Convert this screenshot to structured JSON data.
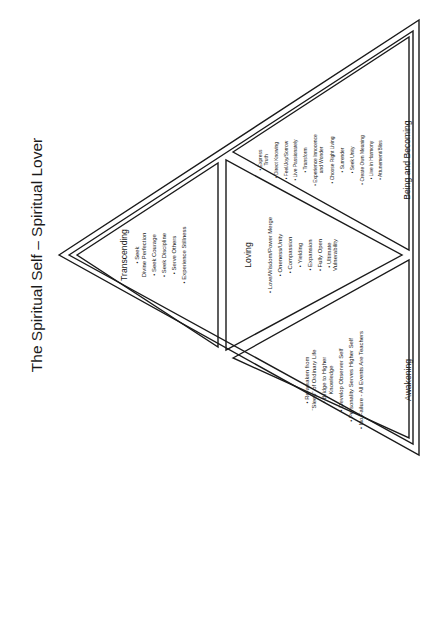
{
  "title": "The Spiritual Self – Spiritual Lover",
  "sections": {
    "transcending": {
      "heading": "Transcending",
      "items": [
        "• Seek",
        "Divine Perfection",
        "• Seek Courage",
        "• Seek Discipline",
        "• Serve Others",
        "• Experience Stillness"
      ]
    },
    "loving": {
      "heading": "Loving",
      "items": [
        "• Love/Wisdom/Power Merge",
        "• Oneness/Unity",
        "• Compassion",
        "• Yielding",
        "• Expansion",
        "• Fully Open",
        "• Ultimate",
        "Vulnerability"
      ]
    },
    "awakening": {
      "heading": "Awakening",
      "items": [
        "• Re-awaken from",
        "“Sleep” of Ordinary Life",
        "• Bridge to Higher",
        "Knowledge",
        "• Develop Observer Self",
        "• Personality Serves Higher Self",
        "• No Failure - All Events Are Teachers"
      ]
    },
    "being_and_becoming": {
      "heading": "Being and Becoming",
      "items": [
        "• Express",
        "Truth",
        "• Direct Knowing",
        "• Feel/Joy/Sorrow",
        "• Live Passionately",
        "• Transform",
        "• Experience Innocence",
        "and Wonder",
        "• Choose Right Living",
        "• Surrender",
        "• Seek Unity",
        "• Create Own Meaning",
        "• Live in Harmony",
        "• Attunement/Bliss"
      ]
    }
  }
}
